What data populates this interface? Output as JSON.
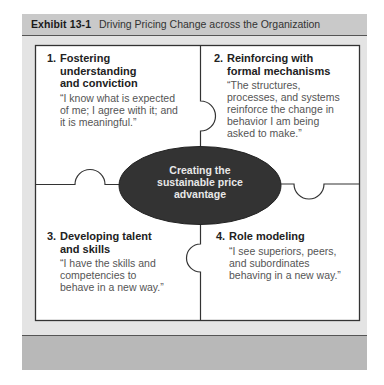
{
  "exhibit": {
    "label": "Exhibit 13-1",
    "title": "Driving Pricing Change across the Organization"
  },
  "center": {
    "text": "Creating the sustainable price advantage",
    "line1": "Creating the",
    "line2": "sustainable price",
    "line3": "advantage",
    "fill": "#333333"
  },
  "quadrants": [
    {
      "number": "1.",
      "heading_lines": [
        "Fostering",
        "understanding",
        "and conviction"
      ],
      "quote_lines": [
        "“I know what is expected",
        "of me; I agree with it; and",
        "it is meaningful.”"
      ]
    },
    {
      "number": "2.",
      "heading_lines": [
        "Reinforcing with",
        "formal mechanisms"
      ],
      "quote_lines": [
        "“The structures,",
        "processes, and systems",
        "reinforce the change in",
        "behavior I am being",
        "asked to make.”"
      ]
    },
    {
      "number": "3.",
      "heading_lines": [
        "Developing talent",
        "and skills"
      ],
      "quote_lines": [
        "“I have the skills and",
        "competencies to",
        "behave in a new way.”"
      ]
    },
    {
      "number": "4.",
      "heading_lines": [
        "Role modeling"
      ],
      "quote_lines": [
        "“I see superiors, peers,",
        "and subordinates",
        "behaving in a new way.”"
      ]
    }
  ],
  "colors": {
    "header_bg": "#c9c9c9",
    "panel_bg": "#e4e4e4",
    "footer_bg": "#b8b8b8",
    "line": "#333333"
  }
}
